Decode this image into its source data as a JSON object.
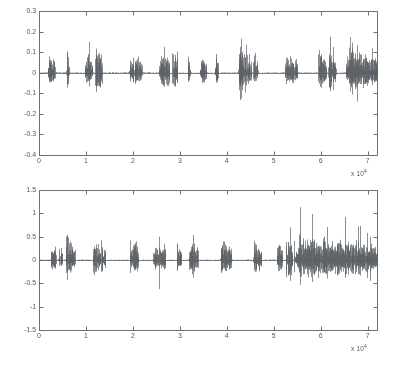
{
  "figure": {
    "background_color": "#ffffff",
    "axis_color": "#6b7075",
    "trace_color": "#5a5f64",
    "tick_label_color": "#555a5e"
  },
  "chart_data": [
    {
      "type": "line",
      "name": "top-waveform",
      "title": "",
      "xlabel": "",
      "ylabel": "",
      "x_multiplier_text": "x 10",
      "x_multiplier_exponent": "4",
      "xlim": [
        0,
        72000
      ],
      "ylim": [
        -0.4,
        0.3
      ],
      "xticks": [
        0,
        10000,
        20000,
        30000,
        40000,
        50000,
        60000,
        70000
      ],
      "xtick_labels": [
        "0",
        "1",
        "2",
        "3",
        "4",
        "5",
        "6",
        "7"
      ],
      "yticks": [
        0.3,
        0.2,
        0.1,
        0,
        -0.1,
        -0.2,
        -0.3,
        -0.4
      ],
      "ytick_labels": [
        "0.3",
        "0.2",
        "0.1",
        "0",
        "-0.1",
        "-0.2",
        "-0.3",
        "-0.4"
      ],
      "grid": false,
      "legend": "none",
      "seed": 20461,
      "baseline": 0,
      "bursts": [
        {
          "start": 1800,
          "end": 3400,
          "amp": 0.055,
          "peak": 0.085,
          "density": 0.95
        },
        {
          "start": 5800,
          "end": 6400,
          "amp": 0.075,
          "peak": 0.215,
          "density": 0.85
        },
        {
          "start": 9700,
          "end": 11400,
          "amp": 0.06,
          "peak": 0.185,
          "density": 0.95
        },
        {
          "start": 11900,
          "end": 13400,
          "amp": 0.085,
          "peak": 0.21,
          "density": 0.95
        },
        {
          "start": 19200,
          "end": 22000,
          "amp": 0.055,
          "peak": 0.115,
          "density": 0.92
        },
        {
          "start": 25500,
          "end": 27800,
          "amp": 0.08,
          "peak": 0.19,
          "density": 0.95
        },
        {
          "start": 28200,
          "end": 29600,
          "amp": 0.075,
          "peak": 0.175,
          "density": 0.92
        },
        {
          "start": 31600,
          "end": 32300,
          "amp": 0.05,
          "peak": 0.155,
          "density": 0.85
        },
        {
          "start": 34200,
          "end": 35600,
          "amp": 0.05,
          "peak": 0.105,
          "density": 0.92
        },
        {
          "start": 37400,
          "end": 38200,
          "amp": 0.055,
          "peak": 0.15,
          "density": 0.85
        },
        {
          "start": 42400,
          "end": 45200,
          "amp": 0.075,
          "peak": 0.205,
          "density": 0.95
        },
        {
          "start": 45600,
          "end": 46600,
          "amp": 0.06,
          "peak": 0.175,
          "density": 0.9
        },
        {
          "start": 52300,
          "end": 55000,
          "amp": 0.055,
          "peak": 0.115,
          "density": 0.92
        },
        {
          "start": 59400,
          "end": 61200,
          "amp": 0.07,
          "peak": 0.2,
          "density": 0.95
        },
        {
          "start": 61600,
          "end": 63200,
          "amp": 0.075,
          "peak": 0.185,
          "density": 0.95
        },
        {
          "start": 65200,
          "end": 72000,
          "amp": 0.075,
          "peak": 0.215,
          "density": 0.99
        }
      ]
    },
    {
      "type": "line",
      "name": "bottom-waveform",
      "title": "",
      "xlabel": "",
      "ylabel": "",
      "x_multiplier_text": "x 10",
      "x_multiplier_exponent": "4",
      "xlim": [
        0,
        72000
      ],
      "ylim": [
        -1.5,
        1.5
      ],
      "xticks": [
        0,
        10000,
        20000,
        30000,
        40000,
        50000,
        60000,
        70000
      ],
      "xtick_labels": [
        "0",
        "1",
        "2",
        "3",
        "4",
        "5",
        "6",
        "7"
      ],
      "yticks": [
        1.5,
        1,
        0.5,
        0,
        -0.5,
        -1,
        -1.5
      ],
      "ytick_labels": [
        "1.5",
        "1",
        "0.5",
        "0",
        "-0.5",
        "-1",
        "-1.5"
      ],
      "grid": false,
      "legend": "none",
      "seed": 90137,
      "baseline": 0,
      "bursts": [
        {
          "start": 2500,
          "end": 3600,
          "amp": 0.28,
          "peak": 0.78,
          "density": 0.92
        },
        {
          "start": 4100,
          "end": 4900,
          "amp": 0.25,
          "peak": 1.02,
          "density": 0.88
        },
        {
          "start": 5600,
          "end": 7600,
          "amp": 0.34,
          "peak": 0.7,
          "density": 0.96
        },
        {
          "start": 11400,
          "end": 13100,
          "amp": 0.3,
          "peak": 0.8,
          "density": 0.95
        },
        {
          "start": 13200,
          "end": 14100,
          "amp": 0.28,
          "peak": 0.86,
          "density": 0.92
        },
        {
          "start": 19300,
          "end": 21100,
          "amp": 0.3,
          "peak": 0.73,
          "density": 0.95
        },
        {
          "start": 24300,
          "end": 25400,
          "amp": 0.26,
          "peak": 0.68,
          "density": 0.9
        },
        {
          "start": 25500,
          "end": 26400,
          "amp": 0.26,
          "peak": 1.07,
          "density": 0.9
        },
        {
          "start": 26400,
          "end": 26900,
          "amp": 0.22,
          "peak": 1.04,
          "density": 0.8
        },
        {
          "start": 29300,
          "end": 30300,
          "amp": 0.25,
          "peak": 0.76,
          "density": 0.9
        },
        {
          "start": 31900,
          "end": 33900,
          "amp": 0.3,
          "peak": 0.7,
          "density": 0.95
        },
        {
          "start": 38600,
          "end": 41000,
          "amp": 0.3,
          "peak": 0.74,
          "density": 0.95
        },
        {
          "start": 45600,
          "end": 47400,
          "amp": 0.28,
          "peak": 0.66,
          "density": 0.94
        },
        {
          "start": 50600,
          "end": 51900,
          "amp": 0.26,
          "peak": 0.82,
          "density": 0.9
        },
        {
          "start": 52500,
          "end": 54000,
          "amp": 0.33,
          "peak": 1.08,
          "density": 0.95
        },
        {
          "start": 54200,
          "end": 72000,
          "amp": 0.34,
          "peak": 1.08,
          "density": 0.99
        }
      ]
    }
  ]
}
